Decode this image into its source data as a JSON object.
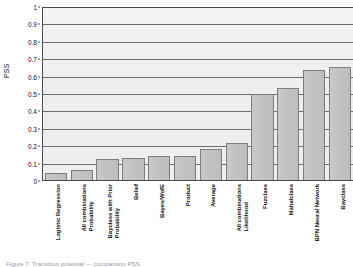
{
  "chart_data": {
    "type": "bar",
    "title": "",
    "xlabel": "",
    "ylabel": "PSS",
    "ylim": [
      0,
      1
    ],
    "ytick_step": 0.1,
    "grid": true,
    "legend": "none",
    "orientation": "vertical",
    "bar_color": "#c4c4c4",
    "bar_edge_color": "#7d7d7d",
    "categories": [
      "Logistic Regression",
      "All combinations Probability",
      "Bayclass with Prior Probability",
      "Belief",
      "Bayes/WofE",
      "Product",
      "Average",
      "All combinations Likelihood",
      "Fuzclass",
      "Mahalclass",
      "BPN Neural Network",
      "Bayclass"
    ],
    "category_lines": [
      [
        "Logistic Regression",
        ""
      ],
      [
        "All combinations",
        "Probability"
      ],
      [
        "Bayclass with Prior",
        "Probability"
      ],
      [
        "Belief",
        ""
      ],
      [
        "Bayes/WofE",
        ""
      ],
      [
        "Product",
        ""
      ],
      [
        "Average",
        ""
      ],
      [
        "All combinations",
        "Likelihood"
      ],
      [
        "Fuzclass",
        ""
      ],
      [
        "Mahalclass",
        ""
      ],
      [
        "BPN Neural Network",
        ""
      ],
      [
        "Bayclass",
        ""
      ]
    ],
    "values": [
      0.04,
      0.06,
      0.12,
      0.13,
      0.14,
      0.14,
      0.18,
      0.215,
      0.5,
      0.53,
      0.635,
      0.655
    ],
    "ytick_labels": [
      "1",
      "0.9",
      "0.8",
      "0.7",
      "0.6",
      "0.5",
      "0.4",
      "0.3",
      "0.2",
      "0.1",
      "0"
    ],
    "ytick_values": [
      1,
      0.9,
      0.8,
      0.7,
      0.6,
      0.5,
      0.4,
      0.3,
      0.2,
      0.1,
      0
    ]
  },
  "caption": {
    "text": "Figure 7. Transition potential — comparison PSS"
  }
}
